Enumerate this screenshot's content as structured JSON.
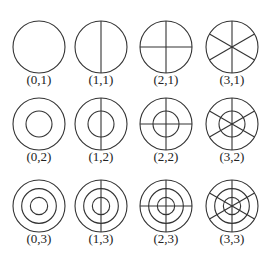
{
  "diagram": {
    "columns": [
      0,
      1,
      2,
      3
    ],
    "rows": [
      1,
      2,
      3
    ],
    "cells": [
      {
        "label": "(0,1)",
        "rings": 1,
        "diameters": 0
      },
      {
        "label": "(1,1)",
        "rings": 1,
        "diameters": 1
      },
      {
        "label": "(2,1)",
        "rings": 1,
        "diameters": 2
      },
      {
        "label": "(3,1)",
        "rings": 1,
        "diameters": 3
      },
      {
        "label": "(0,2)",
        "rings": 2,
        "diameters": 0
      },
      {
        "label": "(1,2)",
        "rings": 2,
        "diameters": 1
      },
      {
        "label": "(2,2)",
        "rings": 2,
        "diameters": 2
      },
      {
        "label": "(3,2)",
        "rings": 2,
        "diameters": 3
      },
      {
        "label": "(0,3)",
        "rings": 3,
        "diameters": 0
      },
      {
        "label": "(1,3)",
        "rings": 3,
        "diameters": 1
      },
      {
        "label": "(2,3)",
        "rings": 3,
        "diameters": 2
      },
      {
        "label": "(3,3)",
        "rings": 3,
        "diameters": 3
      }
    ]
  }
}
